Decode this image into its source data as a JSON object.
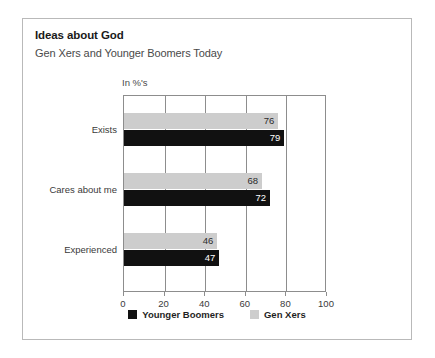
{
  "figure": {
    "title": "Ideas about God",
    "subtitle": "Gen Xers and Younger Boomers Today",
    "units_label": "In %'s"
  },
  "chart_data": {
    "type": "bar",
    "orientation": "horizontal",
    "title": "Ideas about God",
    "subtitle": "Gen Xers and Younger Boomers Today",
    "xlabel": "In %'s",
    "ylabel": "",
    "xlim": [
      0,
      100
    ],
    "xticks": [
      0,
      20,
      40,
      60,
      80,
      100
    ],
    "grid": true,
    "legend_position": "bottom",
    "categories": [
      "Exists",
      "Cares about me",
      "Experienced"
    ],
    "series": [
      {
        "name": "Younger Boomers",
        "color": "#111111",
        "values": [
          79,
          72,
          47
        ]
      },
      {
        "name": "Gen Xers",
        "color": "#cdcdcd",
        "values": [
          76,
          68,
          46
        ]
      }
    ]
  }
}
